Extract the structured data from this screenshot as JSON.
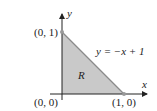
{
  "diagram": {
    "region_label": "R",
    "equation": "y = −x + 1",
    "axis_x_label": "x",
    "axis_y_label": "y",
    "points": [
      {
        "label": "(0, 1)"
      },
      {
        "label": "(0, 0)"
      },
      {
        "label": "(1, 0)"
      }
    ],
    "colors": {
      "region_fill": "#c9c9c9",
      "boundary": "#8a8a8a",
      "axis": "#222222"
    }
  }
}
